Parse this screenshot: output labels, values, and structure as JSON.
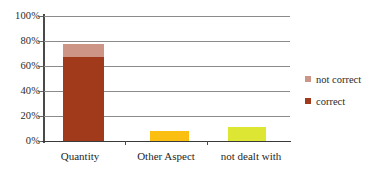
{
  "chart_data": {
    "type": "bar",
    "title": "",
    "subtitle": "",
    "xlabel": "",
    "ylabel": "",
    "categories": [
      "Quantity",
      "Other Aspect",
      "not dealt with"
    ],
    "ylim": [
      0,
      100
    ],
    "y_ticks": [
      "0%",
      "20%",
      "40%",
      "60%",
      "80%",
      "100%"
    ],
    "y_tick_values": [
      0,
      20,
      40,
      60,
      80,
      100
    ],
    "grid": true,
    "legend_position": "right",
    "series": [
      {
        "name": "correct",
        "color": "#a03a1b",
        "values": [
          67,
          0,
          0
        ]
      },
      {
        "name": "not correct",
        "color": "#cc9585",
        "values": [
          11,
          0,
          0
        ]
      }
    ],
    "bar_colors": [
      "#a03a1b",
      "#fbbf12",
      "#dde632"
    ],
    "bar_totals": [
      78,
      8,
      11
    ],
    "annotations": []
  },
  "legend": {
    "items": [
      {
        "label": "not correct",
        "color": "#cc9585"
      },
      {
        "label": "correct",
        "color": "#a03a1b"
      }
    ]
  },
  "axis": {
    "y_labels": [
      "100%",
      "80%",
      "60%",
      "40%",
      "20%",
      "0%"
    ]
  },
  "colors": {
    "gridline": "#8b8b8b",
    "axis": "#3a3a3a",
    "background": "#ffffff",
    "bar_correct": "#a03a1b",
    "bar_not_correct": "#cc9585",
    "bar_other_aspect": "#fbbf12",
    "bar_not_dealt_with": "#dde632"
  }
}
